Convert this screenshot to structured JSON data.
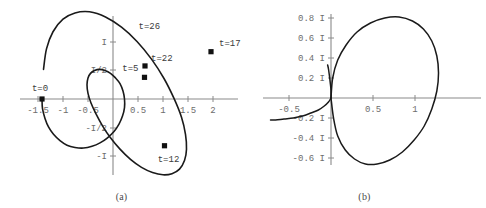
{
  "figure": {
    "background_color": "#ffffff",
    "curve_color": "#1a1a1a",
    "axis_color": "#8a8a8a",
    "tick_label_color": "#6d6d6d",
    "point_color": "#111111"
  },
  "panels": [
    {
      "id": "a",
      "caption": "(a)",
      "chart_data": {
        "type": "line",
        "title": "",
        "xlabel": "",
        "ylabel": "",
        "xlim": [
          -1.75,
          2.6
        ],
        "ylim": [
          -1.45,
          1.35
        ],
        "grid": false,
        "legend": "none",
        "xticks": [
          -1.5,
          -1,
          -0.5,
          0.5,
          1,
          1.5,
          2
        ],
        "xticklabels": [
          "-1.5",
          "-1",
          "-0.5",
          "0.5",
          "1",
          "1.5",
          "2"
        ],
        "yticks": [
          -1,
          -0.5,
          0.5,
          1
        ],
        "yticklabels": [
          "-I",
          "-I/2",
          "I/2",
          "I"
        ],
        "series": [
          {
            "name": "spiral",
            "description": "expanding spiral in complex plane from t=0 to t=26",
            "x": [
              -1.42,
              -1.41,
              -1.36,
              -1.29,
              -1.19,
              -1.06,
              -0.92,
              -0.76,
              -0.59,
              -0.42,
              -0.26,
              -0.11,
              0.02,
              0.12,
              0.19,
              0.23,
              0.23,
              0.2,
              0.14,
              0.05,
              -0.05,
              -0.16,
              -0.27,
              -0.37,
              -0.45,
              -0.5,
              -0.52,
              -0.5,
              -0.44,
              -0.34,
              -0.21,
              -0.05,
              0.14,
              0.35,
              0.57,
              0.79,
              1.0,
              1.18,
              1.33,
              1.43,
              1.47,
              1.45,
              1.37,
              1.22,
              1.02,
              0.77,
              0.48,
              0.17,
              -0.15,
              -0.47,
              -0.76,
              -1.0,
              -1.2,
              -1.33,
              -1.39
            ],
            "y": [
              0.0,
              -0.17,
              -0.34,
              -0.49,
              -0.62,
              -0.73,
              -0.81,
              -0.85,
              -0.86,
              -0.83,
              -0.77,
              -0.68,
              -0.57,
              -0.44,
              -0.3,
              -0.15,
              0.0,
              0.14,
              0.27,
              0.37,
              0.45,
              0.5,
              0.52,
              0.5,
              0.45,
              0.37,
              0.25,
              0.1,
              -0.07,
              -0.26,
              -0.47,
              -0.68,
              -0.88,
              -1.06,
              -1.2,
              -1.29,
              -1.33,
              -1.31,
              -1.23,
              -1.08,
              -0.88,
              -0.62,
              -0.32,
              0.01,
              0.36,
              0.7,
              1.01,
              1.26,
              1.44,
              1.53,
              1.51,
              1.4,
              1.18,
              0.88,
              0.52
            ]
          }
        ],
        "annotations": [
          {
            "label": "t=0",
            "x": -1.42,
            "y": 0.0,
            "marker": true
          },
          {
            "label": "t=5",
            "x": 0.63,
            "y": 0.38,
            "marker": true
          },
          {
            "label": "t=12",
            "x": 1.03,
            "y": -0.82,
            "marker": true
          },
          {
            "label": "t=17",
            "x": 1.96,
            "y": 0.83,
            "marker": true
          },
          {
            "label": "t=22",
            "x": 0.64,
            "y": 0.58,
            "marker": true
          },
          {
            "label": "t=26",
            "x": 0.33,
            "y": 1.15,
            "marker": false
          }
        ]
      }
    },
    {
      "id": "b",
      "caption": "(b)",
      "chart_data": {
        "type": "line",
        "title": "",
        "xlabel": "",
        "ylabel": "",
        "xlim": [
          -0.78,
          1.42
        ],
        "ylim": [
          -0.75,
          0.92
        ],
        "grid": false,
        "legend": "none",
        "xticks": [
          -0.5,
          0.5,
          1
        ],
        "xticklabels": [
          "-0.5",
          "0.5",
          "1"
        ],
        "yticks": [
          -0.6,
          -0.4,
          -0.2,
          0.2,
          0.4,
          0.6,
          0.8
        ],
        "yticklabels": [
          "-0.6 I",
          "-0.4 I",
          "-0.2 I",
          "0.2 I",
          "0.4 I",
          "0.6 I",
          "0.8 I"
        ],
        "series": [
          {
            "name": "main-loop",
            "description": "large closed loop right of origin",
            "x": [
              0.0,
              0.02,
              0.08,
              0.18,
              0.31,
              0.47,
              0.64,
              0.81,
              0.97,
              1.1,
              1.2,
              1.26,
              1.28,
              1.26,
              1.2,
              1.11,
              0.99,
              0.85,
              0.7,
              0.55,
              0.41,
              0.28,
              0.17,
              0.08,
              0.03,
              0.0
            ],
            "y": [
              0.0,
              0.2,
              0.38,
              0.53,
              0.66,
              0.75,
              0.8,
              0.81,
              0.77,
              0.69,
              0.57,
              0.42,
              0.25,
              0.07,
              -0.11,
              -0.28,
              -0.42,
              -0.54,
              -0.62,
              -0.66,
              -0.66,
              -0.61,
              -0.52,
              -0.38,
              -0.2,
              0.0
            ]
          },
          {
            "name": "left-tail",
            "description": "short arc trailing left below axis toward x=-0.7",
            "x": [
              0.0,
              -0.03,
              -0.08,
              -0.15,
              -0.24,
              -0.34,
              -0.45,
              -0.56,
              -0.66,
              -0.72
            ],
            "y": [
              0.0,
              -0.04,
              -0.08,
              -0.12,
              -0.15,
              -0.18,
              -0.2,
              -0.21,
              -0.22,
              -0.22
            ]
          },
          {
            "name": "upper-stub",
            "description": "short arc from just left of origin rising to about 0.33 I",
            "x": [
              0.0,
              0.0,
              -0.01,
              -0.02,
              -0.03,
              -0.04
            ],
            "y": [
              0.0,
              0.08,
              0.16,
              0.23,
              0.29,
              0.33
            ]
          }
        ],
        "annotations": []
      }
    }
  ]
}
